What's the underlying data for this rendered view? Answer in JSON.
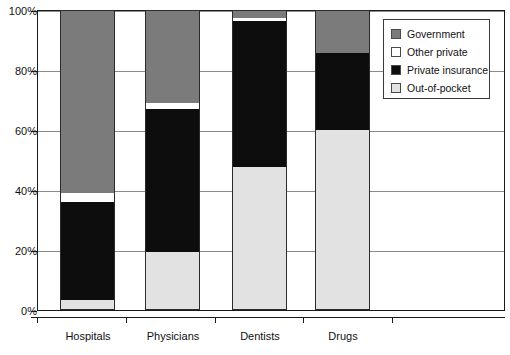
{
  "chart_data": {
    "type": "bar",
    "subtype": "stacked-100-percent",
    "title": "",
    "xlabel": "",
    "ylabel": "",
    "categories": [
      "Hospitals",
      "Physicians",
      "Dentists",
      "Drugs"
    ],
    "ylim": [
      0,
      100
    ],
    "yticks": [
      0,
      20,
      40,
      60,
      80,
      100
    ],
    "ytick_labels": [
      "0%",
      "20%",
      "40%",
      "60%",
      "80%",
      "100%"
    ],
    "grid": true,
    "grid_axis": "y",
    "legend_position": "top-right-outside",
    "stack_order_bottom_to_top": [
      "Out-of-pocket",
      "Private insurance",
      "Other private",
      "Government"
    ],
    "series": [
      {
        "name": "Government",
        "color": "#7b7b7b",
        "values": [
          61.0,
          31.0,
          2.5,
          14.0
        ]
      },
      {
        "name": "Other private",
        "color": "#ffffff",
        "values": [
          3.0,
          2.0,
          1.0,
          0.0
        ]
      },
      {
        "name": "Private insurance",
        "color": "#0d0d0d",
        "values": [
          33.0,
          48.0,
          49.0,
          26.0
        ]
      },
      {
        "name": "Out-of-pocket",
        "color": "#e2e2e2",
        "values": [
          3.0,
          19.0,
          47.5,
          60.0
        ]
      }
    ],
    "annotations": []
  },
  "axis": {
    "y_tick_labels": [
      "100%",
      "80%",
      "60%",
      "40%",
      "20%",
      "0%"
    ],
    "x_category_labels": [
      "Hospitals",
      "Physicians",
      "Dentists",
      "Drugs"
    ]
  },
  "legend": {
    "entries": [
      {
        "label": "Government",
        "swatch_color": "#7b7b7b"
      },
      {
        "label": "Other private",
        "swatch_color": "#ffffff"
      },
      {
        "label": "Private insurance",
        "swatch_color": "#0d0d0d"
      },
      {
        "label": "Out-of-pocket",
        "swatch_color": "#e2e2e2"
      }
    ]
  },
  "colors": {
    "government": "#7b7b7b",
    "other_private": "#ffffff",
    "private_insurance": "#0d0d0d",
    "out_of_pocket": "#e2e2e2",
    "frame": "#1a1a1a",
    "gridline": "#8a8a8a"
  }
}
